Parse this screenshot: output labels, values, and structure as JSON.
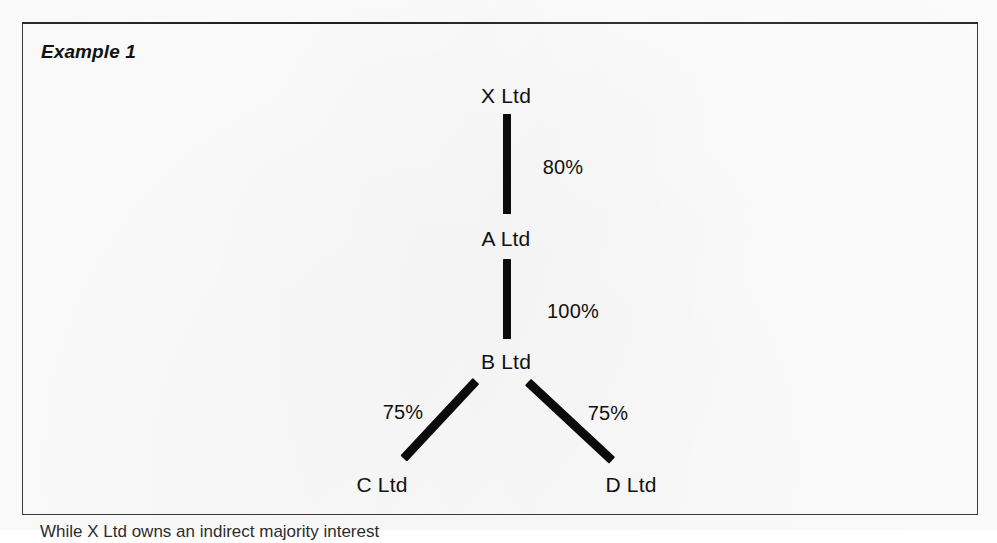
{
  "figure": {
    "title": "Example 1",
    "border_color": "#3a3a3a"
  },
  "diagram": {
    "type": "ownership-tree",
    "line_color": "#0b0b0b",
    "nodes": [
      {
        "id": "X",
        "label": "X Ltd",
        "x": 505,
        "y": 95
      },
      {
        "id": "A",
        "label": "A Ltd",
        "x": 505,
        "y": 238
      },
      {
        "id": "B",
        "label": "B Ltd",
        "x": 505,
        "y": 361
      },
      {
        "id": "C",
        "label": "C Ltd",
        "x": 381,
        "y": 484
      },
      {
        "id": "D",
        "label": "D Ltd",
        "x": 630,
        "y": 484
      }
    ],
    "edges": [
      {
        "from": "X",
        "to": "A",
        "label": "80%",
        "label_x": 562,
        "label_y": 166
      },
      {
        "from": "A",
        "to": "B",
        "label": "100%",
        "label_x": 572,
        "label_y": 310
      },
      {
        "from": "B",
        "to": "C",
        "label": "75%",
        "label_x": 402,
        "label_y": 411
      },
      {
        "from": "B",
        "to": "D",
        "label": "75%",
        "label_x": 607,
        "label_y": 412
      }
    ]
  },
  "below_frame": {
    "text": "While X Ltd owns an indirect majority interest"
  }
}
